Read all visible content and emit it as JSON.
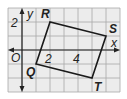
{
  "figure": {
    "type": "coordinate-grid",
    "grid": {
      "x_range": [
        -1,
        7
      ],
      "y_range": [
        -3,
        3
      ],
      "spacing": 1,
      "line_color": "#a8a8a8",
      "background": "#ececec"
    },
    "axes": {
      "x_label": "x",
      "y_label": "y",
      "origin_label": "O",
      "x_ticks": [
        {
          "value": 2,
          "label": "2"
        },
        {
          "value": 4,
          "label": "4"
        }
      ],
      "y_ticks": [
        {
          "value": 2,
          "label": "2"
        }
      ]
    },
    "polygon": {
      "name": "QRST",
      "stroke": "#1a1a1a",
      "vertices": [
        {
          "label": "Q",
          "x": 1,
          "y": -1
        },
        {
          "label": "R",
          "x": 2,
          "y": 2
        },
        {
          "label": "S",
          "x": 6,
          "y": 1
        },
        {
          "label": "T",
          "x": 5,
          "y": -2
        }
      ]
    }
  }
}
